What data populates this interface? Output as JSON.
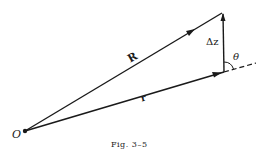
{
  "figure": {
    "caption": "Fig. 3–5",
    "labels": {
      "origin": "O",
      "vector_R": "R",
      "vector_r": "r",
      "delta_z": "Δz",
      "angle": "θ"
    },
    "geometry": {
      "origin": [
        25,
        131
      ],
      "R_tip": [
        222,
        13
      ],
      "r_tip": [
        224,
        72
      ],
      "dashed_end": [
        256,
        63
      ]
    },
    "colors": {
      "ink": "#1a1a1a",
      "background": "#ffffff"
    }
  }
}
